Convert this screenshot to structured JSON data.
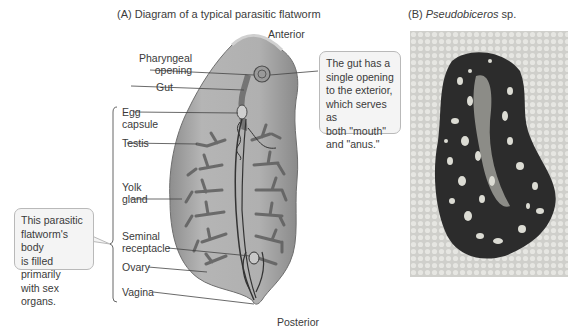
{
  "panel_a": {
    "title": "(A)  Diagram of a typical parasitic flatworm",
    "orientation": {
      "top": "Anterior",
      "bottom": "Posterior"
    },
    "labels": [
      {
        "id": "pharyngeal-opening",
        "text": "Pharyngeal\nopening"
      },
      {
        "id": "gut",
        "text": "Gut"
      },
      {
        "id": "egg-capsule",
        "text": "Egg\ncapsule"
      },
      {
        "id": "testis",
        "text": "Testis"
      },
      {
        "id": "yolk-gland",
        "text": "Yolk\ngland"
      },
      {
        "id": "seminal-receptacle",
        "text": "Seminal\nreceptacle"
      },
      {
        "id": "ovary",
        "text": "Ovary"
      },
      {
        "id": "vagina",
        "text": "Vagina"
      }
    ],
    "callouts": {
      "gut": "The gut has a\nsingle opening\nto the exterior,\nwhich serves as\nboth \"mouth\"\nand \"anus.\"",
      "body": "This parasitic\nflatworm's body\nis filled primarily\nwith sex organs."
    }
  },
  "panel_b": {
    "prefix": "(B)  ",
    "species": "Pseudobiceros",
    "suffix": " sp."
  },
  "colors": {
    "body_fill": "#a8a8a8",
    "body_edge": "#6e6e6e",
    "organ_dark": "#585858",
    "callout_bg": "#f4f4f4",
    "callout_border": "#b9b9b9",
    "photo_bg": "#d9d9d6",
    "worm_dark": "#2a2a2a",
    "worm_spots": "#dcdcd4"
  }
}
